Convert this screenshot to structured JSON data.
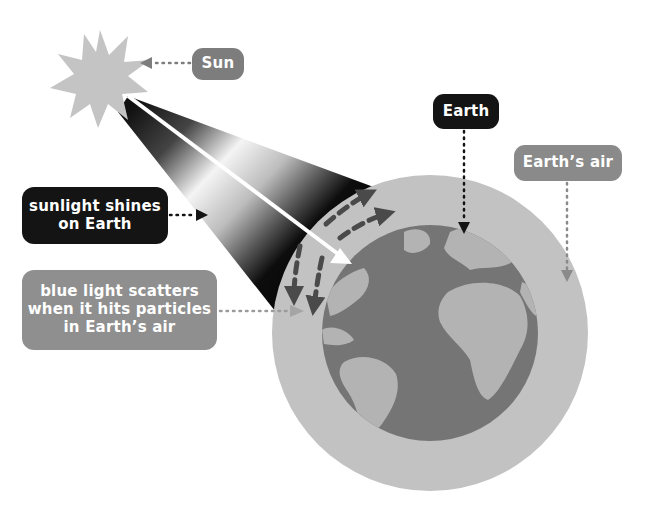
{
  "diagram": {
    "labels": {
      "sun": "Sun",
      "earth": "Earth",
      "earths_air": "Earth’s air",
      "sunlight": "sunlight shines\non Earth",
      "scatter": "blue light scatters\nwhen it hits particles\nin Earth’s air"
    },
    "icons": {
      "sun": "sun-starburst",
      "earth": "globe-atlantic-view",
      "atmosphere": "atmosphere-ring",
      "light_beam": "light-beam-gradient",
      "incoming_ray": "white-arrow",
      "scattered_rays": "dashed-arrows"
    },
    "colors": {
      "background": "#ffffff",
      "sun_fill": "#c4c4c4",
      "atmosphere": "#c2c2c2",
      "ocean": "#757575",
      "land": "#b3b3b3",
      "label_dark": "#141414",
      "label_mid": "#7d7d7d",
      "label_light": "#8f8f8f",
      "scatter_arrow": "#4a4a4a"
    }
  }
}
